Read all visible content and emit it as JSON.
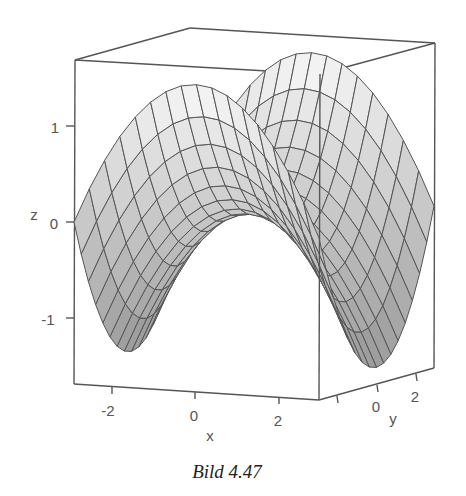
{
  "chart_data": {
    "type": "surface",
    "function_hint": "z = (x^2 - y^2) / c (saddle shape)",
    "title": "",
    "caption": "Bild 4.47",
    "xlabel": "x",
    "ylabel": "y",
    "zlabel": "z",
    "x_ticks": [
      "-2",
      "0",
      "2"
    ],
    "y_ticks": [
      "0",
      "2"
    ],
    "z_ticks": [
      "1",
      "0",
      "-1"
    ],
    "xlim": [
      -3,
      3
    ],
    "ylim": [
      -3,
      3
    ],
    "zlim": [
      -1.8,
      1.8
    ],
    "grid_lines_per_direction": 16,
    "surface_color": "#a8a8a8",
    "mesh_color": "#555555",
    "box": true
  },
  "axes": {
    "x": {
      "label": "x",
      "ticks": [
        "-2",
        "0",
        "2"
      ]
    },
    "y": {
      "label": "y",
      "ticks": [
        "0",
        "2"
      ]
    },
    "z": {
      "label": "z",
      "ticks": [
        "1",
        "0",
        "-1"
      ]
    }
  },
  "caption": "Bild 4.47"
}
